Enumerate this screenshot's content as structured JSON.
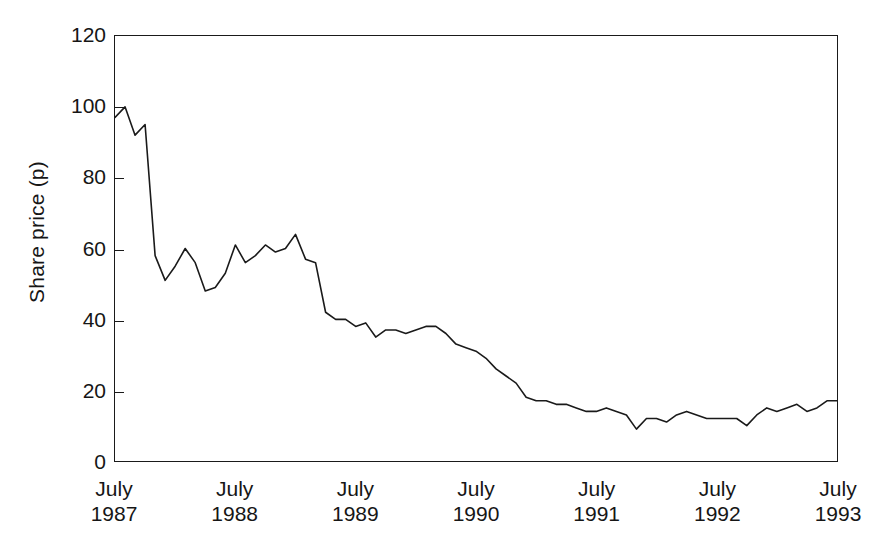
{
  "chart_data": {
    "type": "line",
    "title": "",
    "xlabel": "",
    "ylabel": "Share price (p)",
    "ylim": [
      0,
      120
    ],
    "yticks": [
      0,
      20,
      40,
      60,
      80,
      100,
      120
    ],
    "ytick_labels": [
      "0",
      "20",
      "40",
      "60",
      "80",
      "100",
      "120"
    ],
    "xlim": [
      "1987-07",
      "1993-07"
    ],
    "xtick_labels": [
      {
        "month": "July",
        "year": "1987"
      },
      {
        "month": "July",
        "year": "1988"
      },
      {
        "month": "July",
        "year": "1989"
      },
      {
        "month": "July",
        "year": "1990"
      },
      {
        "month": "July",
        "year": "1991"
      },
      {
        "month": "July",
        "year": "1992"
      },
      {
        "month": "July",
        "year": "1993"
      }
    ],
    "grid": false,
    "legend": null,
    "line_color": "#1a1a1a",
    "line_width": 1.6,
    "series": [
      {
        "name": "Share price (p)",
        "units": "pence",
        "x": [
          "1987-07",
          "1987-08",
          "1987-09",
          "1987-10",
          "1987-11",
          "1987-12",
          "1988-01",
          "1988-02",
          "1988-03",
          "1988-04",
          "1988-05",
          "1988-06",
          "1988-07",
          "1988-08",
          "1988-09",
          "1988-10",
          "1988-11",
          "1988-12",
          "1989-01",
          "1989-02",
          "1989-03",
          "1989-04",
          "1989-05",
          "1989-06",
          "1989-07",
          "1989-08",
          "1989-09",
          "1989-10",
          "1989-11",
          "1989-12",
          "1990-01",
          "1990-02",
          "1990-03",
          "1990-04",
          "1990-05",
          "1990-06",
          "1990-07",
          "1990-08",
          "1990-09",
          "1990-10",
          "1990-11",
          "1990-12",
          "1991-01",
          "1991-02",
          "1991-03",
          "1991-04",
          "1991-05",
          "1991-06",
          "1991-07",
          "1991-08",
          "1991-09",
          "1991-10",
          "1991-11",
          "1991-12",
          "1992-01",
          "1992-02",
          "1992-03",
          "1992-04",
          "1992-05",
          "1992-06",
          "1992-07",
          "1992-08",
          "1992-09",
          "1992-10",
          "1992-11",
          "1992-12",
          "1993-01",
          "1993-02",
          "1993-03",
          "1993-04",
          "1993-05",
          "1993-06",
          "1993-07"
        ],
        "values": [
          97,
          100,
          92,
          95,
          58,
          51,
          55,
          60,
          56,
          48,
          49,
          53,
          61,
          56,
          58,
          61,
          59,
          60,
          64,
          57,
          56,
          42,
          40,
          40,
          38,
          39,
          35,
          37,
          37,
          36,
          37,
          38,
          38,
          36,
          33,
          32,
          31,
          29,
          26,
          24,
          22,
          18,
          17,
          17,
          16,
          16,
          15,
          14,
          14,
          15,
          14,
          13,
          9,
          12,
          12,
          11,
          13,
          14,
          13,
          12,
          12,
          12,
          12,
          10,
          13,
          15,
          14,
          15,
          16,
          14,
          15,
          17,
          17
        ]
      }
    ]
  },
  "axes": {
    "ytitle": "Share price (p)"
  }
}
